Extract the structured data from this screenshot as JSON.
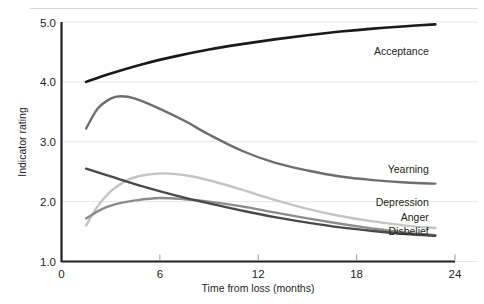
{
  "chart_data": {
    "type": "line",
    "title": "",
    "subtitle": "",
    "xlabel": "Time from loss (months)",
    "ylabel": "Indicator rating",
    "xlim": [
      0,
      24
    ],
    "ylim": [
      1.0,
      5.0
    ],
    "xticks": [
      0,
      6,
      12,
      18,
      24
    ],
    "xtick_labels": [
      "0",
      "6",
      "12",
      "18",
      "24"
    ],
    "yticks": [
      1.0,
      2.0,
      3.0,
      4.0,
      5.0
    ],
    "ytick_labels": [
      "1.0",
      "2.0",
      "3.0",
      "4.0",
      "5.0"
    ],
    "grid": true,
    "grid_axis": "y",
    "legend": "inline-right-labels",
    "series": [
      {
        "name": "Acceptance",
        "color": "#1a1a1a",
        "width": 2.6,
        "label_x": 22.4,
        "label_y": 4.45,
        "x": [
          1.5,
          3,
          5,
          7,
          9,
          11,
          13,
          15,
          17,
          19,
          21,
          22.8
        ],
        "values": [
          4.0,
          4.14,
          4.3,
          4.43,
          4.54,
          4.63,
          4.71,
          4.78,
          4.84,
          4.89,
          4.93,
          4.96
        ]
      },
      {
        "name": "Yearning",
        "color": "#6e6e6e",
        "width": 2.4,
        "label_x": 22.4,
        "label_y": 2.47,
        "x": [
          1.5,
          2.2,
          3.0,
          3.6,
          4.5,
          6.0,
          7.5,
          9.0,
          11.0,
          13.0,
          15.0,
          17.0,
          19.0,
          21.0,
          22.8
        ],
        "values": [
          3.22,
          3.55,
          3.72,
          3.76,
          3.72,
          3.55,
          3.35,
          3.12,
          2.85,
          2.65,
          2.52,
          2.42,
          2.36,
          2.32,
          2.3
        ]
      },
      {
        "name": "Depression",
        "color": "#c4c4c4",
        "width": 2.4,
        "label_x": 22.4,
        "label_y": 1.92,
        "x": [
          1.5,
          2.2,
          3.0,
          4.0,
          5.0,
          6.0,
          7.0,
          8.0,
          9.5,
          11.0,
          13.0,
          15.0,
          17.0,
          19.0,
          21.0,
          22.8
        ],
        "values": [
          1.6,
          1.92,
          2.17,
          2.36,
          2.44,
          2.47,
          2.46,
          2.42,
          2.32,
          2.2,
          2.03,
          1.88,
          1.76,
          1.67,
          1.6,
          1.56
        ]
      },
      {
        "name": "Anger",
        "color": "#8c8c8c",
        "width": 2.4,
        "label_x": 22.4,
        "label_y": 1.68,
        "x": [
          1.5,
          2.5,
          3.5,
          4.5,
          6.0,
          7.5,
          9.0,
          11.0,
          13.0,
          15.0,
          17.0,
          19.0,
          21.0,
          22.8
        ],
        "values": [
          1.72,
          1.88,
          1.97,
          2.02,
          2.06,
          2.04,
          2.0,
          1.92,
          1.82,
          1.72,
          1.63,
          1.55,
          1.48,
          1.44
        ]
      },
      {
        "name": "Disbelief",
        "color": "#4a4a4a",
        "width": 2.4,
        "label_x": 22.4,
        "label_y": 1.45,
        "x": [
          1.5,
          3.0,
          5.0,
          7.0,
          9.0,
          11.0,
          13.0,
          15.0,
          17.0,
          19.0,
          21.0,
          22.8
        ],
        "values": [
          2.55,
          2.42,
          2.25,
          2.1,
          1.97,
          1.85,
          1.74,
          1.65,
          1.57,
          1.51,
          1.46,
          1.43
        ]
      }
    ],
    "colors": {
      "axis": "#231f20",
      "grid": "#e6e6e6",
      "background": "#ffffff"
    }
  }
}
